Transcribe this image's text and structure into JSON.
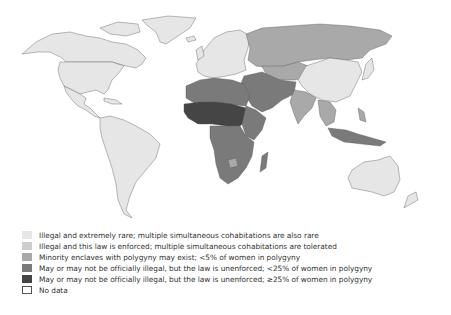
{
  "map": {
    "categories": [
      {
        "id": "c1",
        "label": "Illegal and extremely rare; multiple simultaneous cohabitations are also rare",
        "color": "#e6e6e6"
      },
      {
        "id": "c2",
        "label": "Illegal and this law is enforced; multiple simultaneous cohabitations are tolerated",
        "color": "#cdcdcd"
      },
      {
        "id": "c3",
        "label": "Minority enclaves with polygyny may exist; <5% of women in polygyny",
        "color": "#a9a9a9"
      },
      {
        "id": "c4",
        "label": "May or may not be officially illegal, but the law is unenforced; <25% of women in polygyny",
        "color": "#7a7a7a"
      },
      {
        "id": "c5",
        "label": "May or may not be officially illegal, but the law is unenforced; ≥25% of women in polygyny",
        "color": "#454545"
      },
      {
        "id": "nodata",
        "label": "No data",
        "color": "#ffffff"
      }
    ],
    "border_color": "#555555"
  },
  "legend": {
    "items": [
      {
        "label": "Illegal and extremely rare; multiple simultaneous cohabitations are also rare"
      },
      {
        "label": "Illegal and this law is enforced; multiple simultaneous cohabitations are tolerated"
      },
      {
        "label": "Minority enclaves with polygyny may exist; <5% of women in polygyny"
      },
      {
        "label": "May or may not be officially illegal, but the law is unenforced; <25% of women in polygyny"
      },
      {
        "label": "May or may not be officially illegal, but the law is unenforced; ≥25% of women in polygyny"
      },
      {
        "label": "No data"
      }
    ]
  }
}
